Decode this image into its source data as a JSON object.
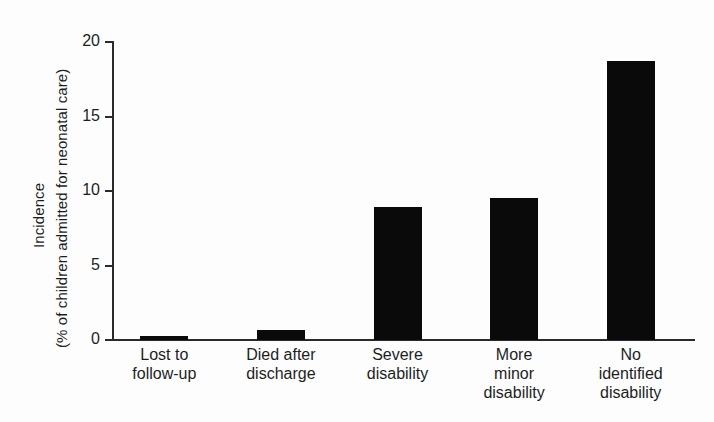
{
  "chart_data": {
    "type": "bar",
    "title": "",
    "subtitle": "",
    "xlabel": "",
    "ylabel": "Incidence (% of children admitted for neonatal care)",
    "ylabel_lines": [
      "Incidence",
      "(% of children admitted for neonatal care)"
    ],
    "categories": [
      "Lost to follow-up",
      "Died after discharge",
      "Severe disability",
      "More minor disability",
      "No identified disability"
    ],
    "category_lines": [
      [
        "Lost to",
        "follow-up"
      ],
      [
        "Died after",
        "discharge"
      ],
      [
        "Severe",
        "disability"
      ],
      [
        "More",
        "minor",
        "disability"
      ],
      [
        "No",
        "identified",
        "disability"
      ]
    ],
    "values": [
      0.3,
      0.7,
      8.9,
      9.5,
      18.7
    ],
    "ylim": [
      0,
      20
    ],
    "yticks": [
      0,
      5,
      10,
      15,
      20
    ],
    "ytick_labels": [
      "0",
      "5",
      "10",
      "15",
      "20"
    ],
    "grid": false,
    "legend": false,
    "legend_position": "none",
    "bar_color": "#0a0a0a",
    "axis_color": "#2a2a2a",
    "background_color": "#fdfdfd",
    "text_color": "#1d1d1d"
  }
}
